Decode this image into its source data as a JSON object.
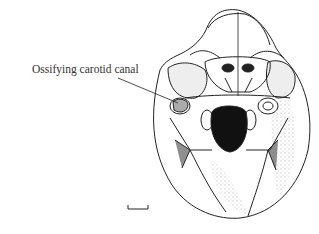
{
  "figure": {
    "annotations": [
      {
        "label": "Ossifying carotid canal"
      }
    ],
    "scale_bar": {
      "visible": true
    },
    "colors": {
      "ink": "#222222",
      "background": "#ffffff"
    }
  }
}
